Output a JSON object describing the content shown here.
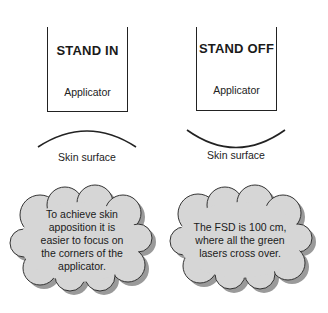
{
  "panels": [
    {
      "title": "STAND IN",
      "applicator_label": "Applicator",
      "surface_label": "Skin surface",
      "surface_shape": "convex"
    },
    {
      "title": "STAND OFF",
      "applicator_label": "Applicator",
      "surface_label": "Skin surface",
      "surface_shape": "concave"
    }
  ],
  "callouts": [
    {
      "lines": [
        "To achieve skin",
        "apposition it is",
        "easier to focus on",
        "the corners of the",
        "applicator."
      ]
    },
    {
      "lines": [
        "The FSD is 100 cm,",
        "where all the green",
        "lasers cross over."
      ]
    }
  ],
  "colors": {
    "cloud_fill": "#d6d6d6",
    "cloud_shadow": "#9a9a9a",
    "line": "#222222"
  }
}
